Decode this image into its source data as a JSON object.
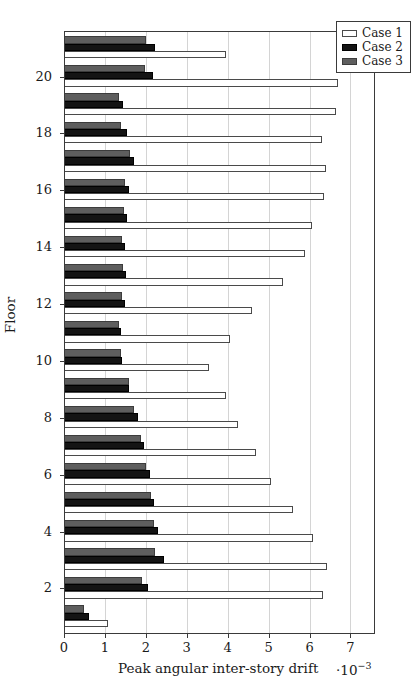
{
  "chart_data": {
    "type": "bar",
    "orientation": "horizontal",
    "title": "",
    "xlabel": "Peak angular inter-story drift",
    "x_exponent": "·10",
    "x_exponent_sup": "−3",
    "ylabel": "Floor",
    "xlim": [
      0,
      7.6
    ],
    "ylim": [
      0.4,
      21.6
    ],
    "xticks": [
      0,
      1,
      2,
      3,
      4,
      5,
      6,
      7
    ],
    "xtick_labels": [
      "0",
      "1",
      "2",
      "3",
      "4",
      "5",
      "6",
      "7"
    ],
    "yticks": [
      2,
      4,
      6,
      8,
      10,
      12,
      14,
      16,
      18,
      20
    ],
    "ytick_labels": [
      "2",
      "4",
      "6",
      "8",
      "10",
      "12",
      "14",
      "16",
      "18",
      "20"
    ],
    "grid": "vertical",
    "legend_position": "top-right",
    "categories": [
      1,
      2,
      3,
      4,
      5,
      6,
      7,
      8,
      9,
      10,
      11,
      12,
      13,
      14,
      15,
      16,
      17,
      18,
      19,
      20,
      21
    ],
    "series": [
      {
        "name": "Case 1",
        "color": "#ffffff",
        "edge": "#4a4a4a",
        "values": [
          1.08,
          6.33,
          6.42,
          6.08,
          5.6,
          5.05,
          4.7,
          4.25,
          3.95,
          3.55,
          4.05,
          4.6,
          5.35,
          5.9,
          6.05,
          6.35,
          6.4,
          6.3,
          6.65,
          6.7,
          3.95
        ]
      },
      {
        "name": "Case 2",
        "color": "#141414",
        "edge": "#000000",
        "values": [
          0.62,
          2.05,
          2.45,
          2.3,
          2.2,
          2.1,
          1.95,
          1.8,
          1.6,
          1.42,
          1.4,
          1.48,
          1.52,
          1.5,
          1.55,
          1.58,
          1.72,
          1.55,
          1.45,
          2.18,
          2.22
        ]
      },
      {
        "name": "Case 3",
        "color": "#5e5e5e",
        "edge": "#3c3c3c",
        "values": [
          0.48,
          1.9,
          2.22,
          2.2,
          2.12,
          2.0,
          1.88,
          1.72,
          1.58,
          1.4,
          1.34,
          1.42,
          1.45,
          1.42,
          1.46,
          1.5,
          1.62,
          1.4,
          1.35,
          1.98,
          2.0
        ]
      }
    ]
  },
  "legend": {
    "items": [
      {
        "label": "Case 1",
        "swatch": "c1"
      },
      {
        "label": "Case 2",
        "swatch": "c2"
      },
      {
        "label": "Case 3",
        "swatch": "c3"
      }
    ]
  }
}
